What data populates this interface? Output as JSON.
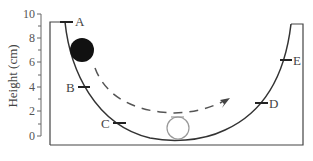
{
  "diagram": {
    "type": "physics-track",
    "y_axis": {
      "title": "Height (cm)",
      "ticks": [
        "0",
        "2",
        "4",
        "6",
        "8",
        "10"
      ]
    },
    "points": [
      {
        "label": "A",
        "height_cm": 9.2
      },
      {
        "label": "B",
        "height_cm": 4.0
      },
      {
        "label": "C",
        "height_cm": 1.1
      },
      {
        "label": "D",
        "height_cm": 2.7
      },
      {
        "label": "E",
        "height_cm": 6.2
      }
    ],
    "objects": {
      "ball": "filled-black-ball",
      "outline_ball": "hollow-ball-at-bottom",
      "path": "dashed-arrow"
    }
  }
}
